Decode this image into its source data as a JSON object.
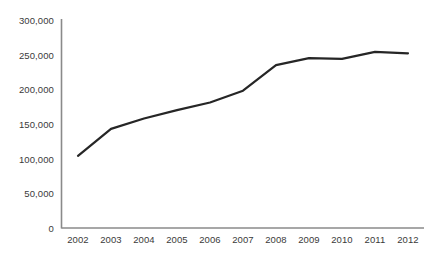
{
  "chart_data": {
    "type": "line",
    "title": "",
    "subtitle": "",
    "xlabel": "",
    "ylabel": "",
    "categories": [
      "2002",
      "2003",
      "2004",
      "2005",
      "2006",
      "2007",
      "2008",
      "2009",
      "2010",
      "2011",
      "2012"
    ],
    "values": [
      104000,
      143000,
      158000,
      170000,
      181000,
      198000,
      235000,
      245000,
      244000,
      254000,
      252000
    ],
    "series": [
      {
        "name": "",
        "values": [
          104000,
          143000,
          158000,
          170000,
          181000,
          198000,
          235000,
          245000,
          244000,
          254000,
          252000
        ]
      }
    ],
    "ylim": [
      0,
      300000
    ],
    "y_ticks": [
      0,
      50000,
      100000,
      150000,
      200000,
      250000,
      300000
    ],
    "y_tick_labels": [
      "0",
      "50,000",
      "100,000",
      "150,000",
      "200,000",
      "250,000",
      "300,000"
    ],
    "x_tick_labels": [
      "2002",
      "2003",
      "2004",
      "2005",
      "2006",
      "2007",
      "2008",
      "2009",
      "2010",
      "2011",
      "2012"
    ],
    "grid": false,
    "legend": false,
    "legend_position": "none",
    "annotations": [],
    "colors": {
      "line": "#262626",
      "axis": "#7f7f7f",
      "tick_text": "#3a3a3a",
      "background": "#ffffff"
    },
    "style": {
      "line_width": 2.2,
      "markers": false,
      "y_axis_visible": true,
      "x_axis_visible": true
    }
  }
}
